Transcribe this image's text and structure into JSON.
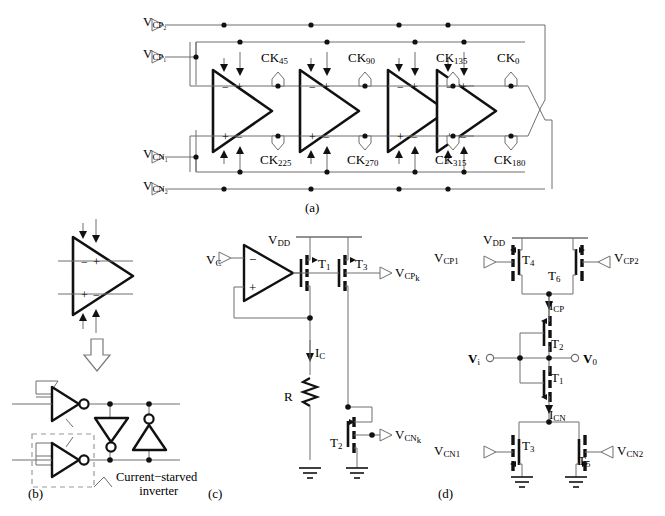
{
  "figure": {
    "type": "circuit-schematic",
    "panels": [
      {
        "id": "a",
        "label": "(a)",
        "title": "four-stage differential ring oscillator"
      },
      {
        "id": "b",
        "label": "(b)",
        "title": "delay cell inverter implementation"
      },
      {
        "id": "c",
        "label": "(c)",
        "title": "bias generator"
      },
      {
        "id": "d",
        "label": "(d)",
        "title": "current-starved inverter"
      }
    ]
  },
  "panel_a": {
    "caption": "(a)",
    "port_labels": [
      {
        "name": "vcp2",
        "base": "V",
        "sub": "CP₂",
        "text": "VCP2"
      },
      {
        "name": "vcp1",
        "base": "V",
        "sub": "CP₁",
        "text": "VCP1"
      },
      {
        "name": "vcn1",
        "base": "V",
        "sub": "CN₁",
        "text": "VCN1"
      },
      {
        "name": "vcn2",
        "base": "V",
        "sub": "CN₂",
        "text": "VCN2"
      }
    ],
    "clock_labels_top": [
      {
        "base": "CK",
        "sub": "45"
      },
      {
        "base": "CK",
        "sub": "90"
      },
      {
        "base": "CK",
        "sub": "135"
      },
      {
        "base": "CK",
        "sub": "0"
      }
    ],
    "clock_labels_bottom": [
      {
        "base": "CK",
        "sub": "225"
      },
      {
        "base": "CK",
        "sub": "270"
      },
      {
        "base": "CK",
        "sub": "315"
      },
      {
        "base": "CK",
        "sub": "180"
      }
    ],
    "stage_count": 4,
    "stage_input_signs_top": [
      "−",
      "+"
    ],
    "stage_input_signs_bottom": [
      "+",
      "−"
    ]
  },
  "panel_b": {
    "caption": "(b)",
    "annotation_line1": "Current−starved",
    "annotation_line2": "inverter",
    "cell_signs_top": [
      "−",
      "+"
    ],
    "cell_signs_bottom": [
      "+",
      "−"
    ]
  },
  "panel_c": {
    "caption": "(c)",
    "labels": [
      {
        "name": "vdd",
        "base": "V",
        "sub": "DD"
      },
      {
        "name": "vc",
        "base": "V",
        "sub": "C"
      },
      {
        "name": "t1",
        "base": "T",
        "sub": "1"
      },
      {
        "name": "t3",
        "base": "T",
        "sub": "3"
      },
      {
        "name": "t2",
        "base": "T",
        "sub": "2"
      },
      {
        "name": "vcpk",
        "base": "V",
        "sub": "CP",
        "sub2": "k"
      },
      {
        "name": "vcnk",
        "base": "V",
        "sub": "CN",
        "sub2": "k"
      },
      {
        "name": "ic",
        "base": "I",
        "sub": "C"
      },
      {
        "name": "r",
        "base": "R",
        "sub": ""
      }
    ],
    "opamp_signs": {
      "minus": "−",
      "plus": "+"
    },
    "vcp_out_text": "VCPk",
    "vcn_out_text": "VCNk",
    "resistor_text": "R",
    "current_text": "IC"
  },
  "panel_d": {
    "caption": "(d)",
    "labels": [
      {
        "name": "vdd",
        "base": "V",
        "sub": "DD"
      },
      {
        "name": "vcp1",
        "base": "V",
        "sub": "CP₁"
      },
      {
        "name": "vcp2",
        "base": "V",
        "sub": "CP₂"
      },
      {
        "name": "vcn1",
        "base": "V",
        "sub": "CN₁"
      },
      {
        "name": "vcn2",
        "base": "V",
        "sub": "CN₂"
      },
      {
        "name": "t4",
        "base": "T",
        "sub": "4"
      },
      {
        "name": "t6",
        "base": "T",
        "sub": "6"
      },
      {
        "name": "t2",
        "base": "T",
        "sub": "2"
      },
      {
        "name": "t1",
        "base": "T",
        "sub": "1"
      },
      {
        "name": "t3",
        "base": "T",
        "sub": "3"
      },
      {
        "name": "t5",
        "base": "T",
        "sub": "5"
      },
      {
        "name": "vi",
        "base": "V",
        "sub": "i"
      },
      {
        "name": "vo",
        "base": "V",
        "sub": "0"
      },
      {
        "name": "icp",
        "base": "I",
        "sub": "CP"
      },
      {
        "name": "icn",
        "base": "I",
        "sub": "CN"
      }
    ],
    "input_text": "Vi",
    "output_text": "V0",
    "icp_text": "ICP",
    "icn_text": "ICN"
  },
  "colors": {
    "line": "#6e6e6e",
    "bold": "#111111",
    "dashed": "#9a9a9a",
    "text": "#000000"
  }
}
